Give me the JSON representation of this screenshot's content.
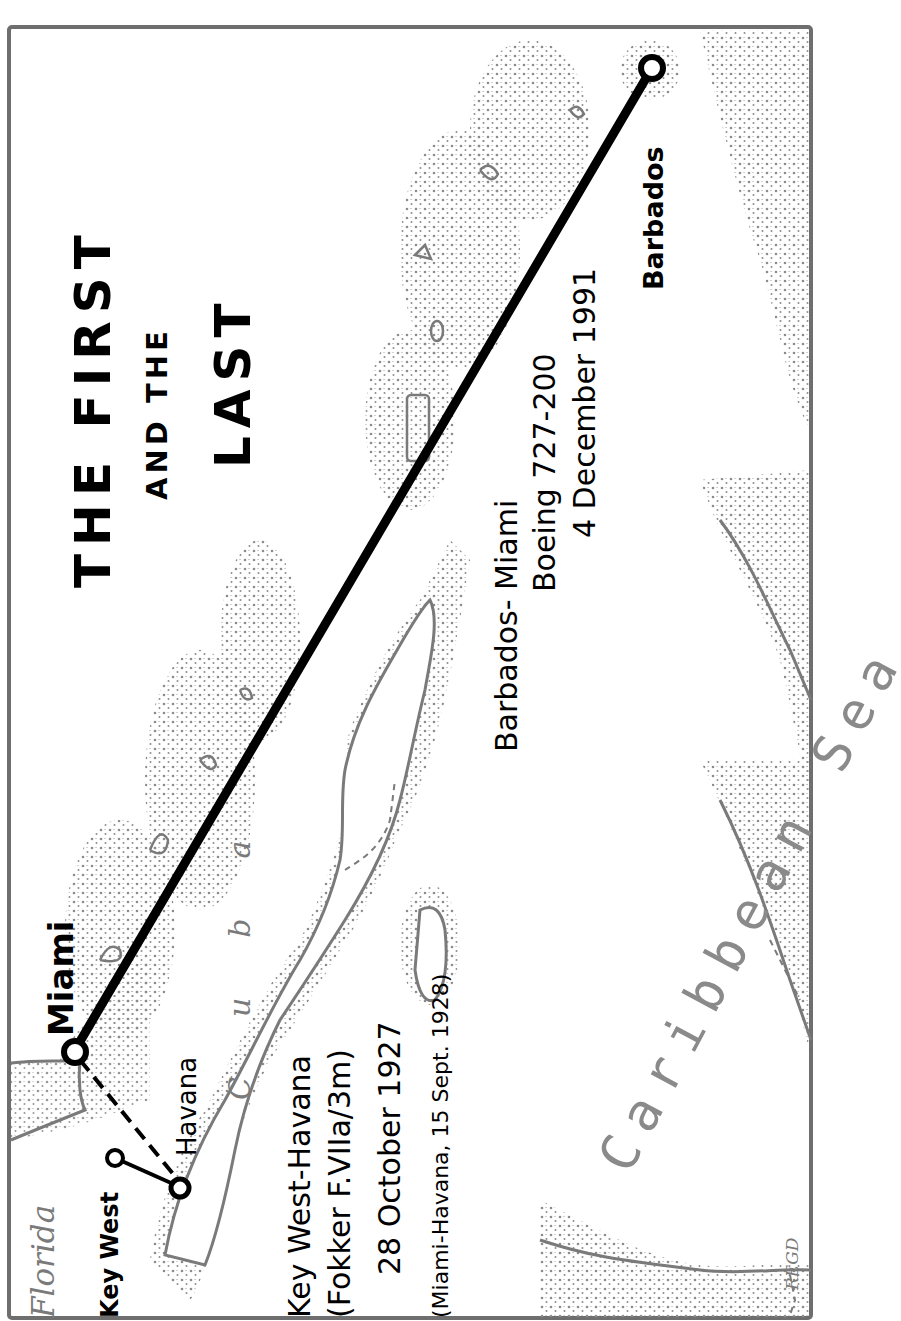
{
  "map": {
    "title_line1": "THE FIRST",
    "title_line2": "AND THE",
    "title_line3": "LAST",
    "places": {
      "miami": "Miami",
      "barbados": "Barbados",
      "key_west": "Key West",
      "havana": "Havana",
      "florida": "Florida",
      "cuba": "Cuba",
      "caribbean_sea": "Caribbean Sea"
    },
    "first_flight": {
      "route": "Key West-Havana",
      "aircraft": "(Fokker F.VIIa/3m)",
      "date": "28 October 1927",
      "note": "(Miami-Havana, 15 Sept. 1928)"
    },
    "last_flight": {
      "route": "Barbados- Miami",
      "aircraft": "Boeing 727-200",
      "date": "4 December 1991"
    },
    "artist_mark": "REGD",
    "colors": {
      "route_line": "#000000",
      "coastline": "#7a7a7a",
      "stipple": "#8c8c8c",
      "border": "#6e6e6e",
      "background": "#ffffff"
    }
  }
}
